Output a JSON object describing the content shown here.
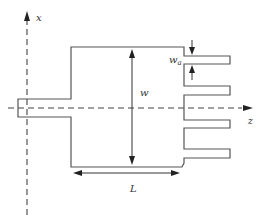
{
  "diagram": {
    "type": "antenna-geometry",
    "colors": {
      "outline": "#555555",
      "axis": "#444444",
      "text": "#333333",
      "background": "#ffffff"
    },
    "labels": {
      "x_axis": "x",
      "z_axis": "z",
      "width": "w",
      "length": "L",
      "finger_width": "w",
      "finger_width_sub": "a"
    }
  }
}
